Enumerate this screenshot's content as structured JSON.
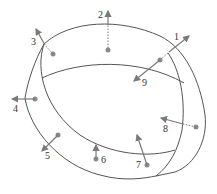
{
  "diagram": {
    "title": "",
    "colors": {
      "stroke": "#555555",
      "point": "#8a8a8a",
      "arrow": "#7a7a7a",
      "background": "#ffffff"
    },
    "labels": [
      {
        "id": "1",
        "text": "1"
      },
      {
        "id": "2",
        "text": "2"
      },
      {
        "id": "3",
        "text": "3"
      },
      {
        "id": "4",
        "text": "4"
      },
      {
        "id": "5",
        "text": "5"
      },
      {
        "id": "6",
        "text": "6"
      },
      {
        "id": "7",
        "text": "7"
      },
      {
        "id": "8",
        "text": "8"
      },
      {
        "id": "9",
        "text": "9"
      }
    ]
  }
}
